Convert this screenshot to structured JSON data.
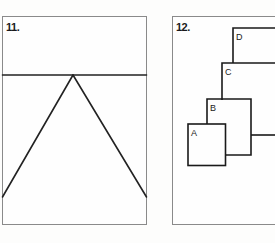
{
  "panels": [
    {
      "number": "11.",
      "figure": "triangle-with-horizontal-line",
      "stroke_color": "#222222"
    },
    {
      "number": "12.",
      "figure": "nested-stepped-rectangles",
      "labels": [
        "A",
        "B",
        "C",
        "D"
      ],
      "stroke_color": "#1a1a1a"
    }
  ]
}
